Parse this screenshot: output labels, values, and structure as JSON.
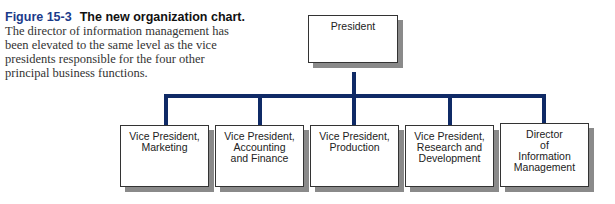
{
  "caption": {
    "figure_number": "Figure 15-3",
    "title": "The new organization chart.",
    "body_lines": [
      "The director of information management has",
      "been elevated to the same level as the vice",
      "presidents responsible for the four other",
      "principal business functions."
    ]
  },
  "org_chart": {
    "root": {
      "label_lines": [
        "President"
      ]
    },
    "children": [
      {
        "label_lines": [
          "Vice President,",
          "Marketing"
        ]
      },
      {
        "label_lines": [
          "Vice President,",
          "Accounting",
          "and Finance"
        ]
      },
      {
        "label_lines": [
          "Vice President,",
          "Production"
        ]
      },
      {
        "label_lines": [
          "Vice President,",
          "Research and",
          "Development"
        ]
      },
      {
        "label_lines": [
          "Director",
          "of",
          "Information",
          "Management"
        ]
      }
    ]
  },
  "colors": {
    "connector": "#0f2a66",
    "figure_number": "#1a3a8a",
    "box_shadow": "#8a8a8a"
  }
}
